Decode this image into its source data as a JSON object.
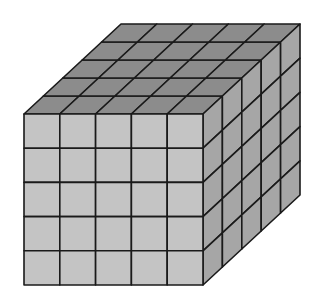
{
  "figure": {
    "grid": {
      "rows": 5,
      "cols": 5,
      "depth": 5
    },
    "geometry": {
      "front": {
        "x0": 24,
        "y0": 114,
        "x1": 203,
        "y1": 285
      },
      "offset": {
        "dx": 97,
        "dy": -90
      }
    },
    "colors": {
      "background": "#ffffff",
      "front": "#c4c4c4",
      "top": "#8c8c8c",
      "side": "#a6a6a6",
      "line": "#1a1a1a"
    }
  }
}
